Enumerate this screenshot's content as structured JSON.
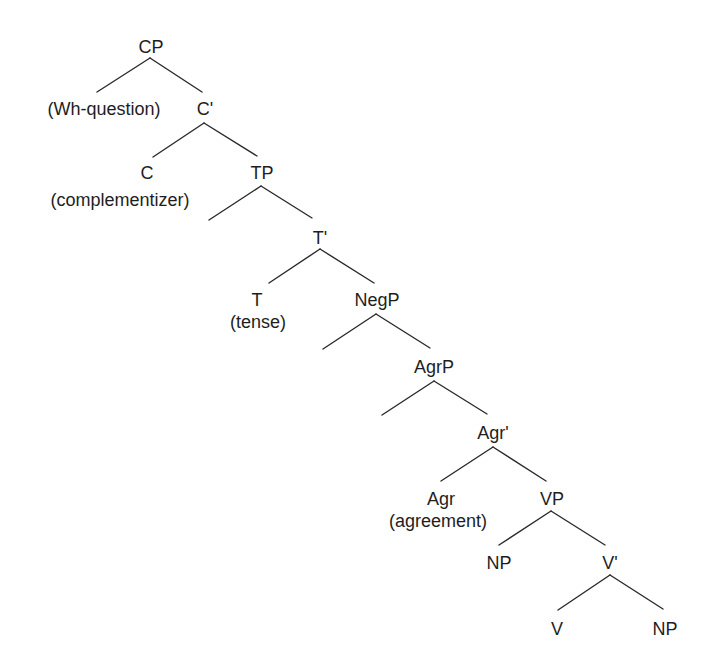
{
  "diagram": {
    "type": "syntax-tree",
    "nodes": [
      {
        "id": "CP",
        "label": "CP",
        "x": 151,
        "y": 53
      },
      {
        "id": "WhQ",
        "label": "(Wh-question)",
        "x": 104,
        "y": 115
      },
      {
        "id": "Cbar",
        "label": "C'",
        "x": 205,
        "y": 115
      },
      {
        "id": "C",
        "label": "C",
        "x": 147,
        "y": 179
      },
      {
        "id": "Comp",
        "label": "(complementizer)",
        "x": 120,
        "y": 206
      },
      {
        "id": "TP",
        "label": "TP",
        "x": 262,
        "y": 179
      },
      {
        "id": "Tbar",
        "label": "T'",
        "x": 320,
        "y": 244
      },
      {
        "id": "T",
        "label": "T",
        "x": 257,
        "y": 306
      },
      {
        "id": "Tense",
        "label": "(tense)",
        "x": 258,
        "y": 328
      },
      {
        "id": "NegP",
        "label": "NegP",
        "x": 377,
        "y": 306
      },
      {
        "id": "AgrP",
        "label": "AgrP",
        "x": 434,
        "y": 373
      },
      {
        "id": "Agrbar",
        "label": "Agr'",
        "x": 493,
        "y": 439
      },
      {
        "id": "Agr",
        "label": "Agr",
        "x": 441,
        "y": 505
      },
      {
        "id": "Agreement",
        "label": "(agreement)",
        "x": 438,
        "y": 527
      },
      {
        "id": "VP",
        "label": "VP",
        "x": 552,
        "y": 505
      },
      {
        "id": "NP1",
        "label": "NP",
        "x": 499,
        "y": 569
      },
      {
        "id": "Vbar",
        "label": "V'",
        "x": 610,
        "y": 569
      },
      {
        "id": "V",
        "label": "V",
        "x": 557,
        "y": 635
      },
      {
        "id": "NP2",
        "label": "NP",
        "x": 665,
        "y": 635
      }
    ],
    "edges": [
      {
        "name": "cp-to-spec",
        "x1": 150,
        "y1": 58,
        "x2": 97,
        "y2": 92
      },
      {
        "name": "cp-to-cbar",
        "x1": 150,
        "y1": 58,
        "x2": 202,
        "y2": 92
      },
      {
        "name": "cbar-to-c",
        "x1": 204,
        "y1": 123,
        "x2": 153,
        "y2": 157
      },
      {
        "name": "cbar-to-tp",
        "x1": 204,
        "y1": 123,
        "x2": 257,
        "y2": 156
      },
      {
        "name": "tp-to-spec",
        "x1": 261,
        "y1": 186,
        "x2": 209,
        "y2": 220
      },
      {
        "name": "tp-to-tbar",
        "x1": 261,
        "y1": 186,
        "x2": 312,
        "y2": 218
      },
      {
        "name": "tbar-to-t",
        "x1": 320,
        "y1": 249,
        "x2": 269,
        "y2": 283
      },
      {
        "name": "tbar-to-negp",
        "x1": 320,
        "y1": 249,
        "x2": 374,
        "y2": 283
      },
      {
        "name": "negp-to-spec",
        "x1": 376,
        "y1": 314,
        "x2": 323,
        "y2": 349
      },
      {
        "name": "negp-to-agrp",
        "x1": 376,
        "y1": 314,
        "x2": 430,
        "y2": 348
      },
      {
        "name": "agrp-to-spec",
        "x1": 434,
        "y1": 381,
        "x2": 382,
        "y2": 415
      },
      {
        "name": "agrp-to-agrbar",
        "x1": 434,
        "y1": 381,
        "x2": 487,
        "y2": 414
      },
      {
        "name": "agrbar-to-agr",
        "x1": 493,
        "y1": 447,
        "x2": 441,
        "y2": 481
      },
      {
        "name": "agrbar-to-vp",
        "x1": 493,
        "y1": 447,
        "x2": 546,
        "y2": 481
      },
      {
        "name": "vp-to-np",
        "x1": 551,
        "y1": 511,
        "x2": 499,
        "y2": 545
      },
      {
        "name": "vp-to-vbar",
        "x1": 551,
        "y1": 511,
        "x2": 605,
        "y2": 545
      },
      {
        "name": "vbar-to-v",
        "x1": 610,
        "y1": 575,
        "x2": 558,
        "y2": 610
      },
      {
        "name": "vbar-to-np",
        "x1": 610,
        "y1": 575,
        "x2": 663,
        "y2": 609
      }
    ]
  }
}
